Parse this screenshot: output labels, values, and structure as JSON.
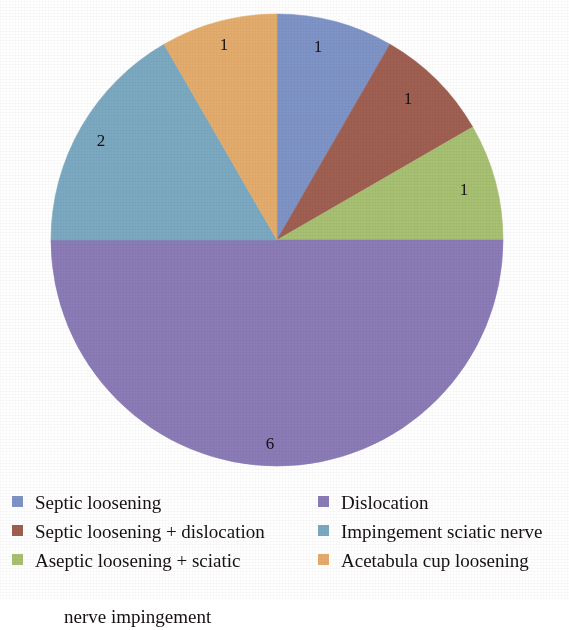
{
  "chart_data": {
    "type": "pie",
    "title": "",
    "subtitle": "",
    "xlabel": "",
    "ylabel": "",
    "total": 12,
    "start_angle_deg": 0,
    "direction": "clockwise",
    "legend_position": "bottom",
    "grid": false,
    "show_data_labels": true,
    "categories": [
      "Septic loosening",
      "Septic loosening + dislocation",
      "Aseptic loosening + sciatic nerve impingement",
      "Dislocation",
      "Impingement sciatic nerve",
      "Acetabula cup loosening"
    ],
    "values": [
      1,
      1,
      1,
      6,
      2,
      1
    ],
    "colors": [
      "#7E93C6",
      "#9F5F51",
      "#A7C072",
      "#8B7BB6",
      "#7BA9C1",
      "#E3AC6C"
    ],
    "slices": [
      {
        "label": "Septic loosening",
        "value": 1,
        "data_label": "1",
        "color": "#7E93C6",
        "start_deg": 0,
        "end_deg": 30,
        "label_x": 318,
        "label_y": 46
      },
      {
        "label": "Septic loosening + dislocation",
        "value": 1,
        "data_label": "1",
        "color": "#9F5F51",
        "start_deg": 30,
        "end_deg": 60,
        "label_x": 408,
        "label_y": 98
      },
      {
        "label": "Aseptic loosening + sciatic nerve impingement",
        "value": 1,
        "data_label": "1",
        "color": "#A7C072",
        "start_deg": 60,
        "end_deg": 90,
        "label_x": 464,
        "label_y": 189
      },
      {
        "label": "Dislocation",
        "value": 6,
        "data_label": "6",
        "color": "#8B7BB6",
        "start_deg": 90,
        "end_deg": 270,
        "label_x": 270,
        "label_y": 443
      },
      {
        "label": "Impingement sciatic nerve",
        "value": 2,
        "data_label": "2",
        "color": "#7BA9C1",
        "start_deg": 270,
        "end_deg": 330,
        "label_x": 101,
        "label_y": 140
      },
      {
        "label": "Acetabula cup loosening",
        "value": 1,
        "data_label": "1",
        "color": "#E3AC6C",
        "start_deg": 330,
        "end_deg": 360,
        "label_x": 224,
        "label_y": 44
      }
    ]
  },
  "pie": {
    "center_x": 277,
    "center_y": 240,
    "radius": 226,
    "labels": {
      "septic_loosening": "1",
      "septic_loosening_dislocation": "1",
      "aseptic_loosening_sciatic": "1",
      "dislocation": "6",
      "impingement_sciatic_nerve": "2",
      "acetabula_cup_loosening": "1"
    }
  },
  "legend": {
    "left_column": [
      {
        "label": "Septic loosening",
        "color": "#7E93C6",
        "line2": ""
      },
      {
        "label": "Septic loosening + dislocation",
        "color": "#9F5F51",
        "line2": ""
      },
      {
        "label": "Aseptic loosening + sciatic",
        "color": "#A7C072",
        "line2": "nerve impingement"
      }
    ],
    "right_column": [
      {
        "label": "Dislocation",
        "color": "#8B7BB6",
        "line2": ""
      },
      {
        "label": "Impingement sciatic nerve",
        "color": "#7BA9C1",
        "line2": ""
      },
      {
        "label": "Acetabula cup loosening",
        "color": "#E3AC6C",
        "line2": ""
      }
    ]
  }
}
